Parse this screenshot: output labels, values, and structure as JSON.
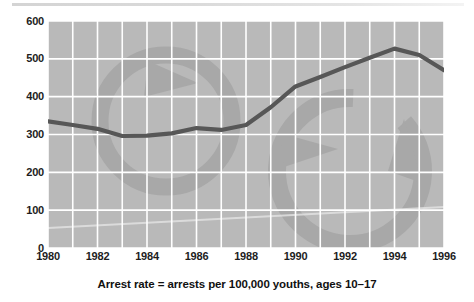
{
  "chart_data": {
    "type": "line",
    "title": "",
    "subtitle": "",
    "caption": "Arrest rate = arrests per 100,000 youths, ages 10–17",
    "xlabel": "",
    "ylabel": "",
    "x": [
      1980,
      1981,
      1982,
      1983,
      1984,
      1985,
      1986,
      1987,
      1988,
      1989,
      1990,
      1991,
      1992,
      1993,
      1994,
      1995,
      1996
    ],
    "values": [
      335,
      325,
      315,
      296,
      297,
      303,
      317,
      312,
      325,
      372,
      427,
      452,
      478,
      503,
      527,
      510,
      470
    ],
    "series": [
      {
        "name": "Juvenile arrest rate",
        "values": [
          335,
          325,
          315,
          296,
          297,
          303,
          317,
          312,
          325,
          372,
          427,
          452,
          478,
          503,
          527,
          510,
          470
        ]
      }
    ],
    "x_tick_labels": [
      "1980",
      "1982",
      "1984",
      "1986",
      "1988",
      "1990",
      "1992",
      "1994",
      "1996"
    ],
    "x_tick_values": [
      1980,
      1982,
      1984,
      1986,
      1988,
      1990,
      1992,
      1994,
      1996
    ],
    "y_tick_labels": [
      "600",
      "500",
      "400",
      "300",
      "200",
      "100",
      "0"
    ],
    "y_tick_values": [
      600,
      500,
      400,
      300,
      200,
      100,
      0
    ],
    "xlim": [
      1980,
      1996
    ],
    "ylim": [
      0,
      600
    ],
    "grid": true,
    "grid_color": "#ffffff",
    "legend": false,
    "legend_position": "none",
    "line_color": "#575757",
    "plot_background": "#b9b9b9",
    "page_background": "#ffffff",
    "watermark_color": "#a6a6a6",
    "annotations": []
  },
  "axes": {
    "y_ticks": [
      {
        "label": "600",
        "value": 600
      },
      {
        "label": "500",
        "value": 500
      },
      {
        "label": "400",
        "value": 400
      },
      {
        "label": "300",
        "value": 300
      },
      {
        "label": "200",
        "value": 200
      },
      {
        "label": "100",
        "value": 100
      },
      {
        "label": "0",
        "value": 0
      }
    ],
    "x_ticks": [
      {
        "label": "1980",
        "value": 1980
      },
      {
        "label": "1982",
        "value": 1982
      },
      {
        "label": "1984",
        "value": 1984
      },
      {
        "label": "1986",
        "value": 1986
      },
      {
        "label": "1988",
        "value": 1988
      },
      {
        "label": "1990",
        "value": 1990
      },
      {
        "label": "1992",
        "value": 1992
      },
      {
        "label": "1994",
        "value": 1994
      },
      {
        "label": "1996",
        "value": 1996
      }
    ]
  },
  "caption": {
    "text": "Arrest rate = arrests per 100,000 youths, ages 10–17"
  }
}
